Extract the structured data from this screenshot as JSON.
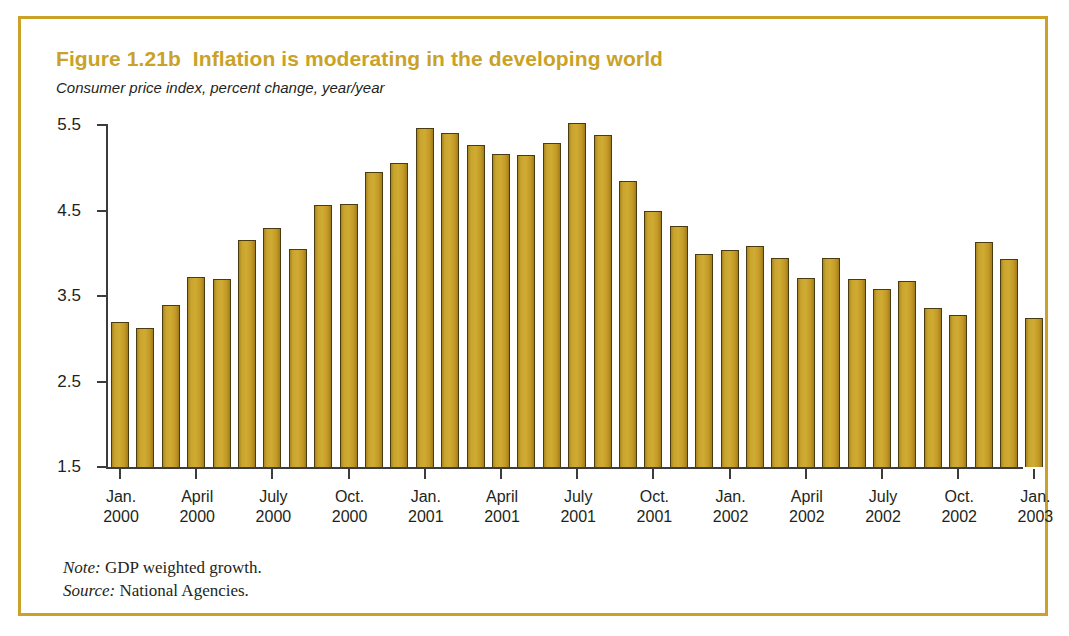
{
  "figure": {
    "title": "Figure 1.21b  Inflation is moderating in the developing world",
    "subtitle": "Consumer price index, percent change, year/year",
    "note_label": "Note:",
    "note_text": " GDP weighted growth.",
    "source_label": "Source:",
    "source_text": " National Agencies.",
    "border_color": "#c9a227",
    "title_color": "#c9a227",
    "bar_color": "#c49a2a",
    "bar_outline_color": "#4a3c12",
    "axis_color": "#3c3c3c"
  },
  "chart_data": {
    "type": "bar",
    "title": "Figure 1.21b  Inflation is moderating in the developing world",
    "subtitle": "Consumer price index, percent change, year/year",
    "xlabel": "",
    "ylabel": "",
    "ylim": [
      1.5,
      5.5
    ],
    "yticks": [
      1.5,
      2.5,
      3.5,
      4.5,
      5.5
    ],
    "ytick_labels": [
      "1.5",
      "2.5",
      "3.5",
      "4.5",
      "5.5"
    ],
    "grid": false,
    "legend": false,
    "xtick_labels": [
      "Jan.\n2000",
      "April\n2000",
      "July\n2000",
      "Oct.\n2000",
      "Jan.\n2001",
      "April\n2001",
      "July\n2001",
      "Oct.\n2001",
      "Jan.\n2002",
      "April\n2002",
      "July\n2002",
      "Oct.\n2002",
      "Jan.\n2003"
    ],
    "xtick_indices": [
      0,
      3,
      6,
      9,
      12,
      15,
      18,
      21,
      24,
      27,
      30,
      33,
      36
    ],
    "categories": [
      "Jan. 2000",
      "Feb. 2000",
      "Mar. 2000",
      "April 2000",
      "May 2000",
      "June 2000",
      "July 2000",
      "Aug. 2000",
      "Sep. 2000",
      "Oct. 2000",
      "Nov. 2000",
      "Dec. 2000",
      "Jan. 2001",
      "Feb. 2001",
      "Mar. 2001",
      "April 2001",
      "May 2001",
      "June 2001",
      "July 2001",
      "Aug. 2001",
      "Sep. 2001",
      "Oct. 2001",
      "Nov. 2001",
      "Dec. 2001",
      "Jan. 2002",
      "Feb. 2002",
      "Mar. 2002",
      "April 2002",
      "May 2002",
      "June 2002",
      "July 2002",
      "Aug. 2002",
      "Sep. 2002",
      "Oct. 2002",
      "Nov. 2002",
      "Dec. 2002",
      "Jan. 2003"
    ],
    "values": [
      3.2,
      3.13,
      3.4,
      3.72,
      3.7,
      4.15,
      4.3,
      4.05,
      4.57,
      4.58,
      4.95,
      5.06,
      5.46,
      5.41,
      5.27,
      5.16,
      5.15,
      5.29,
      5.52,
      5.38,
      4.85,
      4.5,
      4.32,
      3.99,
      4.04,
      4.09,
      3.95,
      3.71,
      3.94,
      3.7,
      3.58,
      3.67,
      3.36,
      3.28,
      4.13,
      3.93,
      3.24
    ],
    "series": [
      {
        "name": "CPI, percent change year/year",
        "values": [
          3.2,
          3.13,
          3.4,
          3.72,
          3.7,
          4.15,
          4.3,
          4.05,
          4.57,
          4.58,
          4.95,
          5.06,
          5.46,
          5.41,
          5.27,
          5.16,
          5.15,
          5.29,
          5.52,
          5.38,
          4.85,
          4.5,
          4.32,
          3.99,
          4.04,
          4.09,
          3.95,
          3.71,
          3.94,
          3.7,
          3.58,
          3.67,
          3.36,
          3.28,
          4.13,
          3.93,
          3.24
        ]
      }
    ]
  }
}
